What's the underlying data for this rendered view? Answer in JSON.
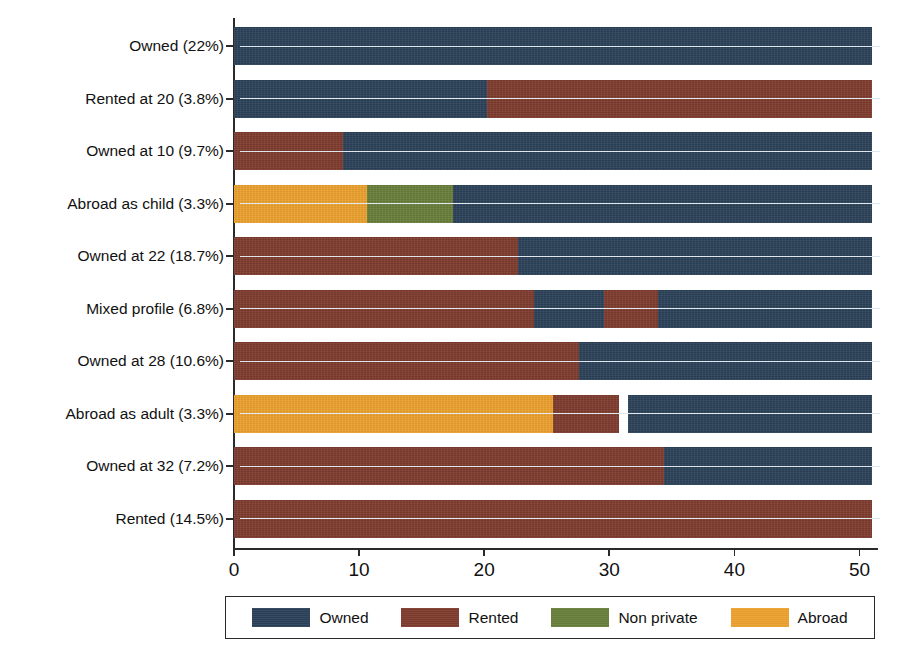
{
  "chart_data": {
    "type": "bar",
    "subtype": "stacked-horizontal",
    "title": "",
    "subtitle": "",
    "xlabel": "",
    "ylabel": "",
    "xlim": [
      0,
      51
    ],
    "xticks": [
      0,
      10,
      20,
      30,
      40,
      50
    ],
    "xticklabels": [
      "0",
      "10",
      "20",
      "30",
      "40",
      "50"
    ],
    "grid": false,
    "legend_position": "bottom",
    "legend": [
      {
        "name": "Owned",
        "color": "#2c4259"
      },
      {
        "name": "Rented",
        "color": "#7f3c2e"
      },
      {
        "name": "Non private",
        "color": "#69803a"
      },
      {
        "name": "Abroad",
        "color": "#edа22e"
      }
    ],
    "series_names": [
      "Owned",
      "Rented",
      "Non private",
      "Abroad"
    ],
    "categories": [
      "Owned (22%)",
      "Rented at 20 (3.8%)",
      "Owned at 10 (9.7%)",
      "Abroad as child (3.3%)",
      "Owned at 22 (18.7%)",
      "Mixed profile (6.8%)",
      "Owned at 28 (10.6%)",
      "Abroad as adult (3.3%)",
      "Owned at 32 (7.2%)",
      "Rented (14.5%)"
    ],
    "rows": [
      {
        "category": "Owned (22%)",
        "share": 22.0,
        "segments": [
          {
            "series": "Owned",
            "start": 0.0,
            "end": 51.0,
            "value": 51.0
          }
        ]
      },
      {
        "category": "Rented at 20 (3.8%)",
        "share": 3.8,
        "segments": [
          {
            "series": "Owned",
            "start": 0.0,
            "end": 20.2,
            "value": 20.2
          },
          {
            "series": "Rented",
            "start": 20.2,
            "end": 51.0,
            "value": 30.8
          }
        ]
      },
      {
        "category": "Owned at 10 (9.7%)",
        "share": 9.7,
        "segments": [
          {
            "series": "Rented",
            "start": 0.0,
            "end": 8.7,
            "value": 8.7
          },
          {
            "series": "Owned",
            "start": 8.7,
            "end": 51.0,
            "value": 42.3
          }
        ]
      },
      {
        "category": "Abroad as child (3.3%)",
        "share": 3.3,
        "segments": [
          {
            "series": "Abroad",
            "start": 0.0,
            "end": 10.6,
            "value": 10.6
          },
          {
            "series": "Non private",
            "start": 10.6,
            "end": 17.5,
            "value": 6.9
          },
          {
            "series": "Owned",
            "start": 17.5,
            "end": 51.0,
            "value": 33.5
          }
        ]
      },
      {
        "category": "Owned at 22 (18.7%)",
        "share": 18.7,
        "segments": [
          {
            "series": "Rented",
            "start": 0.0,
            "end": 22.7,
            "value": 22.7
          },
          {
            "series": "Owned",
            "start": 22.7,
            "end": 51.0,
            "value": 28.3
          }
        ]
      },
      {
        "category": "Mixed profile (6.8%)",
        "share": 6.8,
        "segments": [
          {
            "series": "Rented",
            "start": 0.0,
            "end": 24.0,
            "value": 24.0
          },
          {
            "series": "Owned",
            "start": 24.0,
            "end": 29.6,
            "value": 5.6
          },
          {
            "series": "Rented",
            "start": 29.6,
            "end": 33.9,
            "value": 4.3
          },
          {
            "series": "Owned",
            "start": 33.9,
            "end": 51.0,
            "value": 17.1
          }
        ]
      },
      {
        "category": "Owned at 28 (10.6%)",
        "share": 10.6,
        "segments": [
          {
            "series": "Rented",
            "start": 0.0,
            "end": 27.6,
            "value": 27.6
          },
          {
            "series": "Owned",
            "start": 27.6,
            "end": 51.0,
            "value": 23.4
          }
        ]
      },
      {
        "category": "Abroad as adult (3.3%)",
        "share": 3.3,
        "segments": [
          {
            "series": "Abroad",
            "start": 0.0,
            "end": 25.5,
            "value": 25.5
          },
          {
            "series": "Rented",
            "start": 25.5,
            "end": 30.8,
            "value": 5.3
          },
          {
            "series": "Owned",
            "start": 31.5,
            "end": 51.0,
            "value": 19.5
          }
        ]
      },
      {
        "category": "Owned at 32 (7.2%)",
        "share": 7.2,
        "segments": [
          {
            "series": "Rented",
            "start": 0.0,
            "end": 34.4,
            "value": 34.4
          },
          {
            "series": "Owned",
            "start": 34.4,
            "end": 51.0,
            "value": 16.6
          }
        ]
      },
      {
        "category": "Rented (14.5%)",
        "share": 14.5,
        "segments": [
          {
            "series": "Rented",
            "start": 0.0,
            "end": 51.0,
            "value": 51.0
          }
        ]
      }
    ]
  },
  "colors": {
    "owned": "#2c4259",
    "rented": "#7f3c2e",
    "non_private": "#69803a",
    "abroad": "#eda22e",
    "axis": "#2a2a2a",
    "background": "#ffffff",
    "leader": "#dfe6ee"
  }
}
